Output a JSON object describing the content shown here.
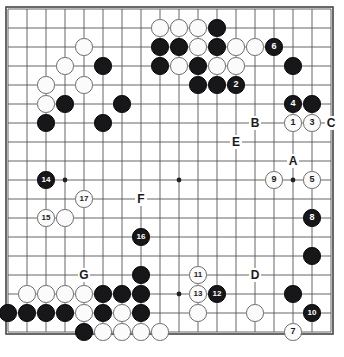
{
  "app": {
    "title": "Go Board Diagram",
    "board_size": 18,
    "description": "Go game diagram with numbered move sequence and lettered reference points"
  },
  "board": {
    "line_color": "#555555",
    "border_color": "#444444",
    "background_color": "#ffffff",
    "black_stone_color": "#17171a",
    "white_stone_color": "#fbfbfb",
    "white_stone_border": "#6b6b6b",
    "grid_origin_x": 8,
    "grid_origin_y": 9,
    "grid_spacing": 19,
    "cols": 18,
    "rows": 18,
    "star_points": [
      {
        "col": 3,
        "row": 3
      },
      {
        "col": 9,
        "row": 3
      },
      {
        "col": 15,
        "row": 3
      },
      {
        "col": 3,
        "row": 9
      },
      {
        "col": 9,
        "row": 9
      },
      {
        "col": 15,
        "row": 9
      },
      {
        "col": 3,
        "row": 15
      },
      {
        "col": 9,
        "row": 15
      },
      {
        "col": 15,
        "row": 15
      }
    ]
  },
  "stones": [
    {
      "col": 8,
      "row": 1,
      "color": "white",
      "label": ""
    },
    {
      "col": 9,
      "row": 1,
      "color": "white",
      "label": ""
    },
    {
      "col": 10,
      "row": 1,
      "color": "white",
      "label": ""
    },
    {
      "col": 11,
      "row": 1,
      "color": "black",
      "label": ""
    },
    {
      "col": 4,
      "row": 2,
      "color": "white",
      "label": ""
    },
    {
      "col": 8,
      "row": 2,
      "color": "black",
      "label": ""
    },
    {
      "col": 9,
      "row": 2,
      "color": "black",
      "label": ""
    },
    {
      "col": 10,
      "row": 2,
      "color": "white",
      "label": ""
    },
    {
      "col": 11,
      "row": 2,
      "color": "black",
      "label": ""
    },
    {
      "col": 12,
      "row": 2,
      "color": "white",
      "label": ""
    },
    {
      "col": 13,
      "row": 2,
      "color": "white",
      "label": ""
    },
    {
      "col": 14,
      "row": 2,
      "color": "black",
      "label": "6"
    },
    {
      "col": 3,
      "row": 3,
      "color": "white",
      "label": ""
    },
    {
      "col": 5,
      "row": 3,
      "color": "black",
      "label": ""
    },
    {
      "col": 8,
      "row": 3,
      "color": "black",
      "label": ""
    },
    {
      "col": 9,
      "row": 3,
      "color": "white",
      "label": ""
    },
    {
      "col": 10,
      "row": 3,
      "color": "black",
      "label": ""
    },
    {
      "col": 11,
      "row": 3,
      "color": "white",
      "label": ""
    },
    {
      "col": 12,
      "row": 3,
      "color": "white",
      "label": ""
    },
    {
      "col": 15,
      "row": 3,
      "color": "black",
      "label": ""
    },
    {
      "col": 2,
      "row": 4,
      "color": "white",
      "label": ""
    },
    {
      "col": 4,
      "row": 4,
      "color": "white",
      "label": ""
    },
    {
      "col": 10,
      "row": 4,
      "color": "black",
      "label": ""
    },
    {
      "col": 11,
      "row": 4,
      "color": "black",
      "label": ""
    },
    {
      "col": 12,
      "row": 4,
      "color": "black",
      "label": "2"
    },
    {
      "col": 2,
      "row": 5,
      "color": "white",
      "label": ""
    },
    {
      "col": 3,
      "row": 5,
      "color": "black",
      "label": ""
    },
    {
      "col": 6,
      "row": 5,
      "color": "black",
      "label": ""
    },
    {
      "col": 15,
      "row": 5,
      "color": "black",
      "label": "4"
    },
    {
      "col": 16,
      "row": 5,
      "color": "black",
      "label": ""
    },
    {
      "col": 2,
      "row": 6,
      "color": "black",
      "label": ""
    },
    {
      "col": 5,
      "row": 6,
      "color": "black",
      "label": ""
    },
    {
      "col": 15,
      "row": 6,
      "color": "white",
      "label": "1"
    },
    {
      "col": 16,
      "row": 6,
      "color": "white",
      "label": "3"
    },
    {
      "col": 2,
      "row": 9,
      "color": "black",
      "label": "14"
    },
    {
      "col": 14,
      "row": 9,
      "color": "white",
      "label": "9"
    },
    {
      "col": 16,
      "row": 9,
      "color": "white",
      "label": "5"
    },
    {
      "col": 4,
      "row": 10,
      "color": "white",
      "label": "17"
    },
    {
      "col": 16,
      "row": 11,
      "color": "black",
      "label": "8"
    },
    {
      "col": 2,
      "row": 11,
      "color": "white",
      "label": "15"
    },
    {
      "col": 3,
      "row": 11,
      "color": "white",
      "label": ""
    },
    {
      "col": 7,
      "row": 12,
      "color": "black",
      "label": "16"
    },
    {
      "col": 16,
      "row": 13,
      "color": "black",
      "label": ""
    },
    {
      "col": 7,
      "row": 14,
      "color": "black",
      "label": ""
    },
    {
      "col": 10,
      "row": 14,
      "color": "white",
      "label": "11"
    },
    {
      "col": 1,
      "row": 15,
      "color": "white",
      "label": ""
    },
    {
      "col": 2,
      "row": 15,
      "color": "white",
      "label": ""
    },
    {
      "col": 3,
      "row": 15,
      "color": "white",
      "label": ""
    },
    {
      "col": 4,
      "row": 15,
      "color": "white",
      "label": ""
    },
    {
      "col": 5,
      "row": 15,
      "color": "black",
      "label": ""
    },
    {
      "col": 6,
      "row": 15,
      "color": "black",
      "label": ""
    },
    {
      "col": 7,
      "row": 15,
      "color": "black",
      "label": ""
    },
    {
      "col": 10,
      "row": 15,
      "color": "white",
      "label": "13"
    },
    {
      "col": 11,
      "row": 15,
      "color": "black",
      "label": "12"
    },
    {
      "col": 15,
      "row": 15,
      "color": "black",
      "label": ""
    },
    {
      "col": 0,
      "row": 16,
      "color": "black",
      "label": ""
    },
    {
      "col": 1,
      "row": 16,
      "color": "black",
      "label": ""
    },
    {
      "col": 2,
      "row": 16,
      "color": "black",
      "label": ""
    },
    {
      "col": 3,
      "row": 16,
      "color": "black",
      "label": ""
    },
    {
      "col": 4,
      "row": 16,
      "color": "white",
      "label": ""
    },
    {
      "col": 5,
      "row": 16,
      "color": "black",
      "label": ""
    },
    {
      "col": 6,
      "row": 16,
      "color": "white",
      "label": ""
    },
    {
      "col": 7,
      "row": 16,
      "color": "black",
      "label": ""
    },
    {
      "col": 10,
      "row": 16,
      "color": "white",
      "label": ""
    },
    {
      "col": 13,
      "row": 16,
      "color": "white",
      "label": ""
    },
    {
      "col": 16,
      "row": 16,
      "color": "black",
      "label": "10"
    },
    {
      "col": 4,
      "row": 17,
      "color": "black",
      "label": ""
    },
    {
      "col": 5,
      "row": 17,
      "color": "white",
      "label": ""
    },
    {
      "col": 6,
      "row": 17,
      "color": "white",
      "label": ""
    },
    {
      "col": 7,
      "row": 17,
      "color": "white",
      "label": ""
    },
    {
      "col": 8,
      "row": 17,
      "color": "white",
      "label": ""
    },
    {
      "col": 15,
      "row": 17,
      "color": "white",
      "label": "7"
    }
  ],
  "markers": [
    {
      "label": "A",
      "col": 15,
      "row": 8
    },
    {
      "label": "B",
      "col": 13,
      "row": 6
    },
    {
      "label": "C",
      "col": 17,
      "row": 6
    },
    {
      "label": "E",
      "col": 12,
      "row": 7
    },
    {
      "label": "F",
      "col": 7,
      "row": 10
    },
    {
      "label": "G",
      "col": 4,
      "row": 14
    },
    {
      "label": "D",
      "col": 13,
      "row": 14
    }
  ]
}
